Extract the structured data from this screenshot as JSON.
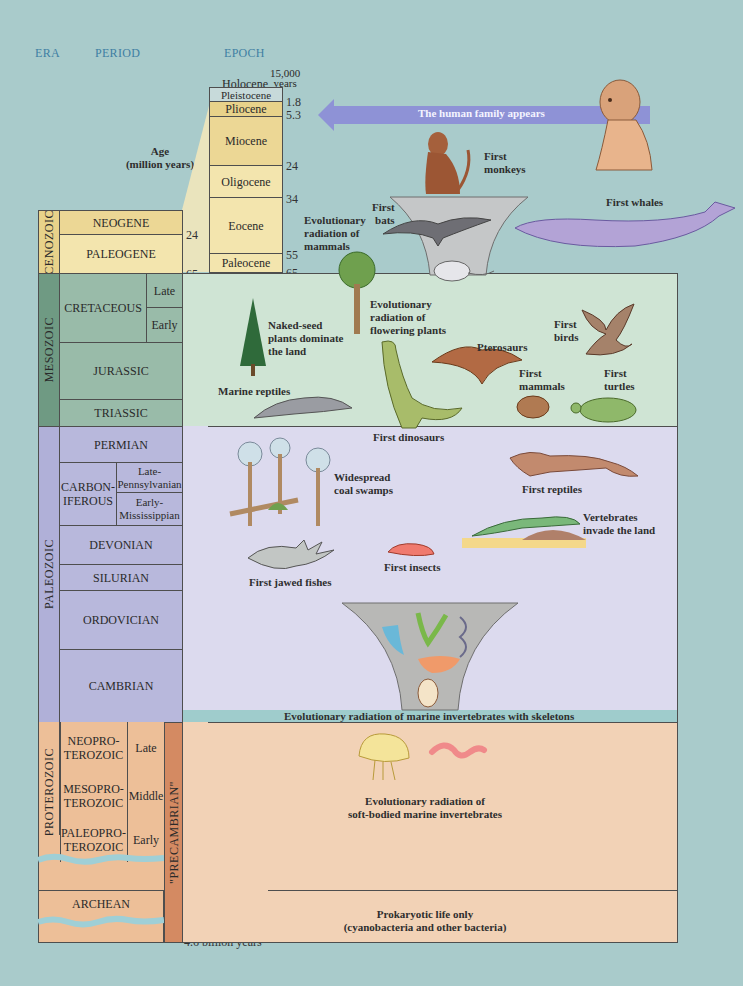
{
  "headers": {
    "era": "ERA",
    "period": "PERIOD",
    "epoch": "EPOCH"
  },
  "age_label": "Age\n(million years)",
  "age_label_line1": "Age",
  "age_label_line2": "(million years)",
  "colors": {
    "background": "#a9cbcb",
    "cenozoic": "#f2e4a8",
    "cenozoic_dark": "#e8d28a",
    "mesozoic": "#99bba9",
    "mesozoic_era": "#6f9a83",
    "mesozoic_panel": "#cfe4d4",
    "paleozoic": "#b8b8dc",
    "paleozoic_panel": "#dcdaee",
    "proterozoic": "#edbf98",
    "precambrian_bar": "#d48a62",
    "wave": "#9fcfd6",
    "arrow": "#8e92d6",
    "skeleton_band": "#9fcccc"
  },
  "eras": [
    {
      "name": "CENOZOIC"
    },
    {
      "name": "MESOZOIC"
    },
    {
      "name": "PALEOZOIC"
    },
    {
      "name": "PROTEROZOIC"
    },
    {
      "name": "\"PRECAMBRIAN\""
    }
  ],
  "periods": {
    "neogene": "NEOGENE",
    "paleogene": "PALEOGENE",
    "cretaceous": "CRETACEOUS",
    "cretaceous_late": "Late",
    "cretaceous_early": "Early",
    "jurassic": "JURASSIC",
    "triassic": "TRIASSIC",
    "permian": "PERMIAN",
    "carboniferous": "CARBON-\nIFEROUS",
    "carboniferous_l1": "CARBON-",
    "carboniferous_l2": "IFEROUS",
    "pennsylvanian_l1": "Late-",
    "pennsylvanian_l2": "Pennsylvanian",
    "mississippian_l1": "Early-",
    "mississippian_l2": "Mississippian",
    "devonian": "DEVONIAN",
    "silurian": "SILURIAN",
    "ordovician": "ORDOVICIAN",
    "cambrian": "CAMBRIAN",
    "neoproterozoic_l1": "NEOPRO-",
    "neoproterozoic_l2": "TEROZOIC",
    "neoproterozoic_sub": "Late",
    "mesoproterozoic_l1": "MESOPRO-",
    "mesoproterozoic_l2": "TEROZOIC",
    "mesoproterozoic_sub": "Middle",
    "paleoproterozoic_l1": "PALEOPRO-",
    "paleoproterozoic_l2": "TEROZOIC",
    "paleoproterozoic_sub": "Early",
    "archean": "ARCHEAN"
  },
  "epochs": {
    "holocene": "Holocene",
    "holocene_age_l1": "15,000",
    "holocene_age_l2": "years",
    "pleistocene": "Pleistocene",
    "pliocene": "Pliocene",
    "miocene": "Miocene",
    "oligocene": "Oligocene",
    "eocene": "Eocene",
    "paleocene": "Paleocene"
  },
  "epoch_ticks": {
    "t1": "1.8",
    "t2": "5.3",
    "t3": "24",
    "t4": "34",
    "t5": "55",
    "t6": "65"
  },
  "ticks": {
    "neogene_end": "24",
    "k65": "65",
    "k99": "99",
    "k142": "142",
    "k202": "202",
    "k251": "251",
    "k292": "292",
    "k320": "320",
    "k354": "354",
    "k417": "417",
    "k440": "440",
    "k495": "495",
    "k545": "545",
    "k1000": "1,000",
    "k1600": "1,600",
    "k2500": "2,500",
    "b25": "2.5 billion years",
    "b46": "4.6 billion years"
  },
  "events": {
    "human_family": "The human family appears",
    "first_monkeys_l1": "First",
    "first_monkeys_l2": "monkeys",
    "first_whales": "First whales",
    "first_bats_l1": "First",
    "first_bats_l2": "bats",
    "mammal_radiation_l1": "Evolutionary",
    "mammal_radiation_l2": "radiation of",
    "mammal_radiation_l3": "mammals",
    "flowering_l1": "Evolutionary",
    "flowering_l2": "radiation of",
    "flowering_l3": "flowering plants",
    "naked_seed_l1": "Naked-seed",
    "naked_seed_l2": "plants dominate",
    "naked_seed_l3": "the land",
    "first_birds_l1": "First",
    "first_birds_l2": "birds",
    "pterosaurs": "Pterosaurs",
    "first_mammals_l1": "First",
    "first_mammals_l2": "mammals",
    "first_turtles_l1": "First",
    "first_turtles_l2": "turtles",
    "marine_reptiles": "Marine reptiles",
    "first_dinosaurs": "First dinosaurs",
    "coal_swamps_l1": "Widespread",
    "coal_swamps_l2": "coal swamps",
    "first_reptiles": "First reptiles",
    "vertebrates_land_l1": "Vertebrates",
    "vertebrates_land_l2": "invade the land",
    "first_insects": "First insects",
    "first_jawed_fishes": "First jawed fishes",
    "skeleton_radiation": "Evolutionary radiation of marine invertebrates with skeletons",
    "soft_bodied_l1": "Evolutionary radiation of",
    "soft_bodied_l2": "soft-bodied marine invertebrates",
    "prokaryotic_l1": "Prokaryotic life only",
    "prokaryotic_l2": "(cyanobacteria and other bacteria)"
  }
}
